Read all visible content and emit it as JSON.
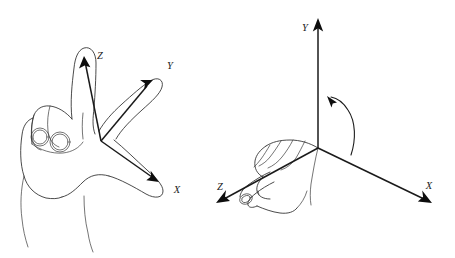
{
  "figure": {
    "background_color": "#ffffff",
    "ink_color": "#2b2b2b",
    "axis_color": "#1a1a1a",
    "width": 455,
    "height": 258
  },
  "panels": [
    {
      "id": "left-panel",
      "name": "open-hand-axes-diagram",
      "description": "Right hand with thumb, index and middle finger extended showing X, Y and Z axes",
      "origin": {
        "x": 101,
        "y": 141
      },
      "axes": [
        {
          "name": "z-axis",
          "label": "Z",
          "tip": {
            "x": 84,
            "y": 58
          },
          "label_pos": {
            "x": 102,
            "y": 57
          }
        },
        {
          "name": "y-axis",
          "label": "Y",
          "tip": {
            "x": 152,
            "y": 82
          },
          "label_pos": {
            "x": 171,
            "y": 67
          }
        },
        {
          "name": "x-axis",
          "label": "X",
          "tip": {
            "x": 158,
            "y": 181
          },
          "label_pos": {
            "x": 177,
            "y": 190
          }
        }
      ]
    },
    {
      "id": "right-panel",
      "name": "fist-rotation-axes-diagram",
      "description": "Right hand in a fist with thumb pointing along the Z axis and a curved arrow showing positive rotation about the Y axis",
      "origin": {
        "x": 318,
        "y": 148
      },
      "axes": [
        {
          "name": "y-axis",
          "label": "Y",
          "tip": {
            "x": 318,
            "y": 19
          },
          "label_pos": {
            "x": 305,
            "y": 28
          }
        },
        {
          "name": "x-axis",
          "label": "X",
          "tip": {
            "x": 430,
            "y": 203
          },
          "label_pos": {
            "x": 428,
            "y": 187
          }
        },
        {
          "name": "z-axis",
          "label": "Z",
          "tip": {
            "x": 217,
            "y": 203
          },
          "label_pos": {
            "x": 220,
            "y": 188
          }
        }
      ],
      "rotation_arrow": {
        "name": "rotation-arc",
        "about_axis": "Y",
        "direction": "counter-clockwise",
        "arrowhead_at": {
          "x": 329,
          "y": 98
        }
      }
    }
  ],
  "labels": {
    "left_z": "Z",
    "left_y": "Y",
    "left_x": "X",
    "right_y": "Y",
    "right_x": "X",
    "right_z": "Z"
  }
}
